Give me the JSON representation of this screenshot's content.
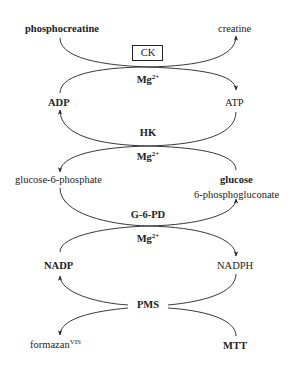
{
  "diagram": {
    "type": "coupled enzymatic reaction cascade",
    "colors": {
      "line": "#222222",
      "text": "#222222",
      "background": "#ffffff"
    },
    "stage1": {
      "enzyme": "CK",
      "cofactor": {
        "base": "Mg",
        "sup": "2+"
      },
      "substrate_left": "phosphocreatine",
      "product_right": "creatine",
      "left_lower": "ADP",
      "right_lower": "ATP"
    },
    "stage2": {
      "enzyme": "HK",
      "cofactor": {
        "base": "Mg",
        "sup": "2+"
      },
      "left_lower": "glucose-6-phosphate",
      "right_lower": "glucose"
    },
    "stage3": {
      "enzyme": "G-6-PD",
      "cofactor": {
        "base": "Mg",
        "sup": "2+"
      },
      "right_upper": "6-phosphogluconate",
      "left_lower": "NADP",
      "right_lower": "NADPH"
    },
    "stage4": {
      "mediator": "PMS",
      "left_lower": {
        "base": "formazan",
        "sup": "VIS"
      },
      "right_lower": "MTT"
    }
  }
}
